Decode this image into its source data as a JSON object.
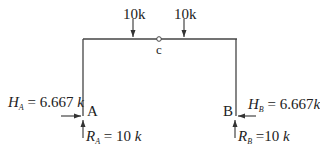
{
  "diagram": {
    "type": "three-hinged frame free-body diagram",
    "loads": [
      {
        "label": "10k",
        "position": "left of hinge c"
      },
      {
        "label": "10k",
        "position": "right of hinge c"
      }
    ],
    "hinge": {
      "label": "c"
    },
    "supports": {
      "A": {
        "label": "A",
        "horizontal": {
          "symbol": "H",
          "sub": "A",
          "eq": " = 6.667 ",
          "unit": "k"
        },
        "vertical": {
          "symbol": "R",
          "sub": "A",
          "eq": " = 10 ",
          "unit": "k"
        }
      },
      "B": {
        "label": "B",
        "horizontal": {
          "symbol": "H",
          "sub": "B",
          "eq": " = 6.667",
          "unit": "k"
        },
        "vertical": {
          "symbol": "R",
          "sub": "B",
          "eq": " =10 ",
          "unit": "k"
        }
      }
    },
    "colors": {
      "line": "#333333",
      "background": "#ffffff"
    }
  }
}
